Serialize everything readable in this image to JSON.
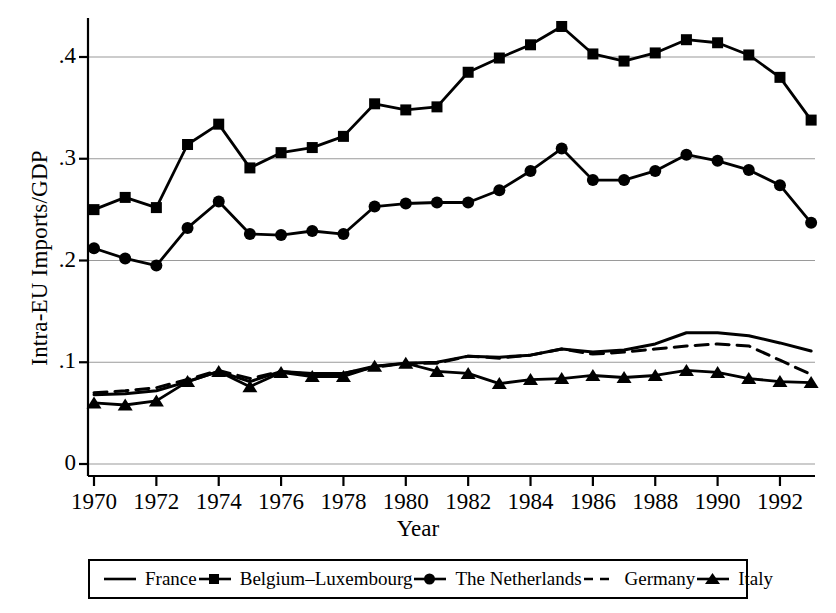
{
  "chart_data": {
    "type": "line",
    "title": "",
    "xlabel": "Year",
    "ylabel": "Intra-EU Imports/GDP",
    "xlim": [
      1969.4,
      1993.6
    ],
    "ylim": [
      0,
      0.455
    ],
    "xticks": [
      1970,
      1972,
      1974,
      1976,
      1978,
      1980,
      1982,
      1984,
      1986,
      1988,
      1990,
      1992
    ],
    "xtick_labels": [
      "1970",
      "1972",
      "1974",
      "1976",
      "1978",
      "1980",
      "1982",
      "1984",
      "1986",
      "1988",
      "1990",
      "1992"
    ],
    "yticks": [
      0,
      0.1,
      0.2,
      0.3,
      0.4
    ],
    "ytick_labels": [
      "0",
      ".1",
      ".2",
      ".3",
      ".4"
    ],
    "grid": "horizontal",
    "legend_position": "below-axes",
    "x": [
      1970,
      1971,
      1972,
      1973,
      1974,
      1975,
      1976,
      1977,
      1978,
      1979,
      1980,
      1981,
      1982,
      1983,
      1984,
      1985,
      1986,
      1987,
      1988,
      1989,
      1990,
      1991,
      1992,
      1993
    ],
    "series": [
      {
        "name": "France",
        "marker": "none",
        "dash": "solid",
        "values": [
          0.068,
          0.069,
          0.072,
          0.081,
          0.091,
          0.081,
          0.091,
          0.089,
          0.089,
          0.096,
          0.099,
          0.1,
          0.106,
          0.105,
          0.107,
          0.113,
          0.11,
          0.112,
          0.118,
          0.129,
          0.129,
          0.126,
          0.119,
          0.111
        ]
      },
      {
        "name": "Belgium–Luxembourg",
        "marker": "square",
        "dash": "solid",
        "values": [
          0.25,
          0.262,
          0.252,
          0.314,
          0.334,
          0.291,
          0.306,
          0.311,
          0.322,
          0.354,
          0.348,
          0.351,
          0.385,
          0.399,
          0.412,
          0.43,
          0.403,
          0.396,
          0.404,
          0.417,
          0.414,
          0.402,
          0.38,
          0.338
        ]
      },
      {
        "name": "The Netherlands",
        "marker": "circle",
        "dash": "solid",
        "values": [
          0.212,
          0.202,
          0.195,
          0.232,
          0.258,
          0.226,
          0.225,
          0.229,
          0.226,
          0.253,
          0.256,
          0.257,
          0.257,
          0.269,
          0.288,
          0.31,
          0.279,
          0.279,
          0.288,
          0.304,
          0.298,
          0.289,
          0.274,
          0.237
        ]
      },
      {
        "name": "Germany",
        "marker": "none",
        "dash": "dashed",
        "values": [
          0.07,
          0.072,
          0.075,
          0.083,
          0.092,
          0.084,
          0.091,
          0.088,
          0.089,
          0.095,
          0.099,
          0.099,
          0.106,
          0.104,
          0.107,
          0.113,
          0.108,
          0.11,
          0.113,
          0.116,
          0.118,
          0.116,
          0.102,
          0.088
        ]
      },
      {
        "name": "Italy",
        "marker": "triangle",
        "dash": "solid",
        "values": [
          0.06,
          0.058,
          0.062,
          0.081,
          0.091,
          0.076,
          0.09,
          0.086,
          0.086,
          0.096,
          0.099,
          0.091,
          0.089,
          0.079,
          0.083,
          0.084,
          0.087,
          0.085,
          0.087,
          0.092,
          0.09,
          0.084,
          0.081,
          0.08
        ]
      }
    ]
  },
  "axis": {
    "ylabel": "Intra-EU Imports/GDP",
    "xlabel": "Year"
  },
  "legend": {
    "entries": [
      {
        "label": "France",
        "key": "line-solid"
      },
      {
        "label": "Belgium–Luxembourg",
        "key": "line-square"
      },
      {
        "label": "The Netherlands",
        "key": "line-circle"
      },
      {
        "label": "Germany",
        "key": "line-dashed"
      },
      {
        "label": "Italy",
        "key": "line-triangle"
      }
    ]
  },
  "colors": {
    "line": "#000000",
    "grid": "#9a9a9a",
    "axis": "#000000",
    "background": "#ffffff"
  }
}
